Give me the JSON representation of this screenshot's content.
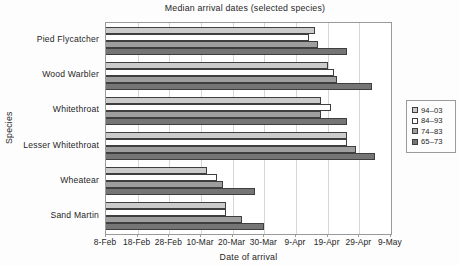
{
  "figure_background": "#fdfdfd",
  "plot_border_color": "#9a9a9a",
  "gridline_color": "#d6d6d6",
  "bar_border_color": "#3f3f3f",
  "chart_data": {
    "type": "bar",
    "orientation": "horizontal",
    "title": "Median arrival dates (selected species)",
    "xlabel": "Date of arrival",
    "ylabel": "Species",
    "grid": "vertical-only",
    "legend_position": "right",
    "categories": [
      "Pied Flycatcher",
      "Wood Warbler",
      "Whitethroat",
      "Lesser Whitethroat",
      "Wheatear",
      "Sand Martin"
    ],
    "x_tick_labels": [
      "8-Feb",
      "18-Feb",
      "28-Feb",
      "10-Mar",
      "20-Mar",
      "30-Mar",
      "9-Apr",
      "19-Apr",
      "29-Apr",
      "9-May"
    ],
    "x_axis": {
      "start_date": "8-Feb",
      "end_date": "9-May",
      "tick_interval_days": 10,
      "range_days": [
        0,
        90
      ]
    },
    "series": [
      {
        "name": "94–03",
        "color": "#cbcbcb",
        "values_days_after_8_feb": [
          66,
          70,
          68,
          76,
          32,
          38
        ],
        "values_dates": [
          "15-Apr",
          "19-Apr",
          "17-Apr",
          "25-Apr",
          "12-Mar",
          "18-Mar"
        ]
      },
      {
        "name": "84–93",
        "color": "#ffffff",
        "values_days_after_8_feb": [
          64,
          72,
          71,
          76,
          35,
          38
        ],
        "values_dates": [
          "13-Apr",
          "21-Apr",
          "20-Apr",
          "25-Apr",
          "15-Mar",
          "18-Mar"
        ]
      },
      {
        "name": "74–83",
        "color": "#9e9e9e",
        "values_days_after_8_feb": [
          67,
          73,
          68,
          79,
          37,
          43
        ],
        "values_dates": [
          "16-Apr",
          "22-Apr",
          "17-Apr",
          "28-Apr",
          "17-Mar",
          "23-Mar"
        ]
      },
      {
        "name": "65–73",
        "color": "#757575",
        "values_days_after_8_feb": [
          76,
          84,
          76,
          85,
          47,
          50
        ],
        "values_dates": [
          "25-Apr",
          "3-May",
          "25-Apr",
          "4-May",
          "27-Mar",
          "30-Mar"
        ]
      }
    ]
  }
}
